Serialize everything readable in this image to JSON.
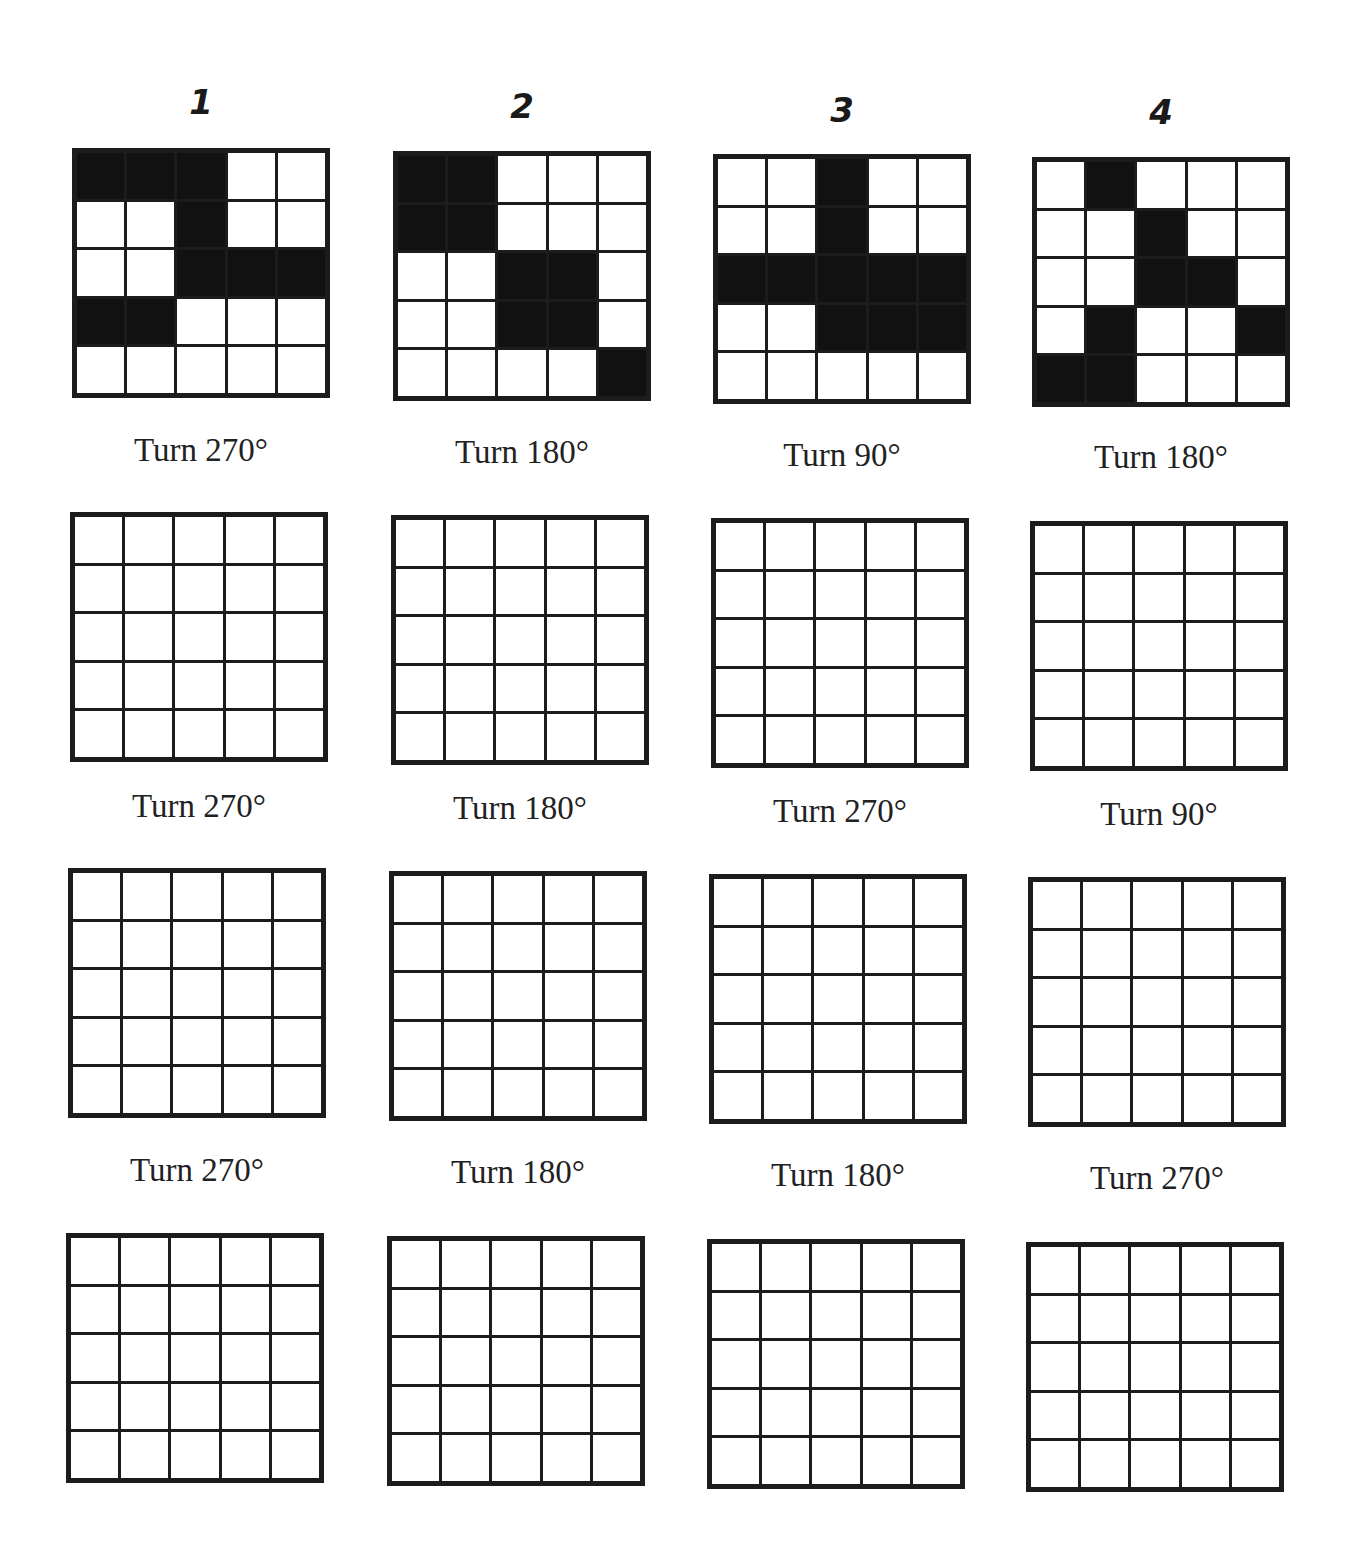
{
  "columns": [
    {
      "number": "1"
    },
    {
      "number": "2"
    },
    {
      "number": "3"
    },
    {
      "number": "4"
    }
  ],
  "puzzles": [
    {
      "source_pattern": [
        [
          1,
          1,
          1,
          0,
          0
        ],
        [
          0,
          0,
          1,
          0,
          0
        ],
        [
          0,
          0,
          1,
          1,
          1
        ],
        [
          1,
          1,
          0,
          0,
          0
        ],
        [
          0,
          0,
          0,
          0,
          0
        ]
      ],
      "steps": [
        "Turn 270°",
        "Turn 270°",
        "Turn 270°"
      ]
    },
    {
      "source_pattern": [
        [
          1,
          1,
          0,
          0,
          0
        ],
        [
          1,
          1,
          0,
          0,
          0
        ],
        [
          0,
          0,
          1,
          1,
          0
        ],
        [
          0,
          0,
          1,
          1,
          0
        ],
        [
          0,
          0,
          0,
          0,
          1
        ]
      ],
      "steps": [
        "Turn 180°",
        "Turn 180°",
        "Turn 180°"
      ]
    },
    {
      "source_pattern": [
        [
          0,
          0,
          1,
          0,
          0
        ],
        [
          0,
          0,
          1,
          0,
          0
        ],
        [
          1,
          1,
          1,
          1,
          1
        ],
        [
          0,
          0,
          1,
          1,
          1
        ],
        [
          0,
          0,
          0,
          0,
          0
        ]
      ],
      "steps": [
        "Turn 90°",
        "Turn 270°",
        "Turn 180°"
      ]
    },
    {
      "source_pattern": [
        [
          0,
          1,
          0,
          0,
          0
        ],
        [
          0,
          0,
          1,
          0,
          0
        ],
        [
          0,
          0,
          1,
          1,
          0
        ],
        [
          0,
          1,
          0,
          0,
          1
        ],
        [
          1,
          1,
          0,
          0,
          0
        ]
      ],
      "steps": [
        "Turn 180°",
        "Turn 90°",
        "Turn 270°"
      ]
    }
  ],
  "colors": {
    "filled": "#111111",
    "empty": "#ffffff",
    "lines": "#1c1c1c"
  }
}
